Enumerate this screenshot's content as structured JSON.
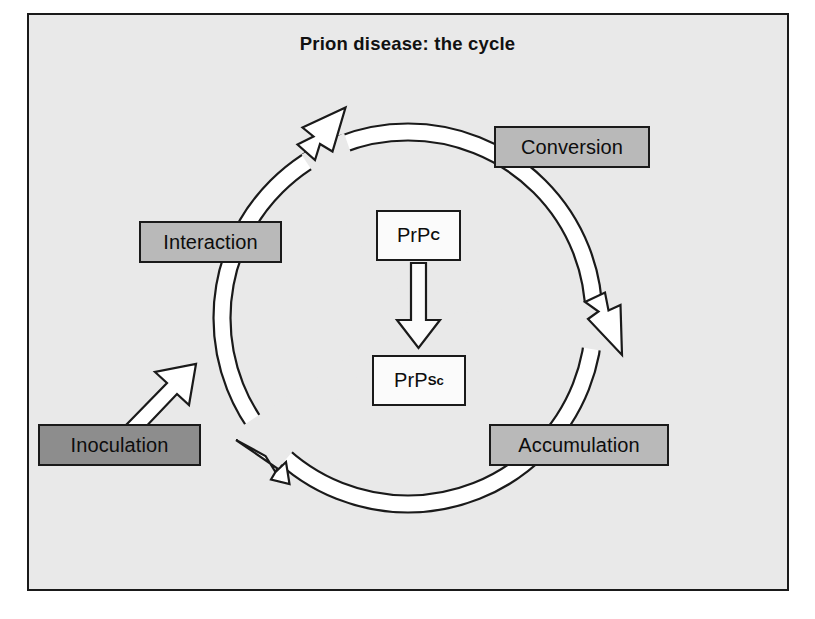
{
  "figure": {
    "title": "Prion disease: the cycle",
    "background_color": "#e9e9e9",
    "frame_color": "#1a1a1a"
  },
  "colors": {
    "stage_box_fill": "#b9b9b9",
    "source_box_fill": "#8d8d8d",
    "protein_box_fill": "#fbfbfb",
    "ribbon_fill": "#ffffff",
    "outline": "#1a1a1a"
  },
  "cycle": {
    "direction": "clockwise",
    "nodes": [
      {
        "id": "interaction",
        "label": "Interaction",
        "type": "stage",
        "position": "left"
      },
      {
        "id": "conversion",
        "label": "Conversion",
        "type": "stage",
        "position": "top-right"
      },
      {
        "id": "accumulation",
        "label": "Accumulation",
        "type": "stage",
        "position": "bottom-right"
      }
    ],
    "entry": {
      "id": "inoculation",
      "label": "Inoculation",
      "type": "source",
      "position": "bottom-left"
    },
    "arrows": [
      {
        "from": "interaction",
        "to": "conversion",
        "shape": "arc",
        "location": "top"
      },
      {
        "from": "conversion",
        "to": "accumulation",
        "shape": "arc",
        "location": "right"
      },
      {
        "from": "accumulation",
        "to": "interaction",
        "shape": "arc",
        "location": "bottom"
      },
      {
        "from": "inoculation",
        "to": "cycle",
        "shape": "straight",
        "location": "lower-left"
      }
    ]
  },
  "center": {
    "conversion_step": {
      "from": {
        "base": "PrP",
        "superscript": "C"
      },
      "to": {
        "base": "PrP",
        "superscript": "Sc"
      },
      "arrow": "down-arrow-hollow"
    }
  }
}
